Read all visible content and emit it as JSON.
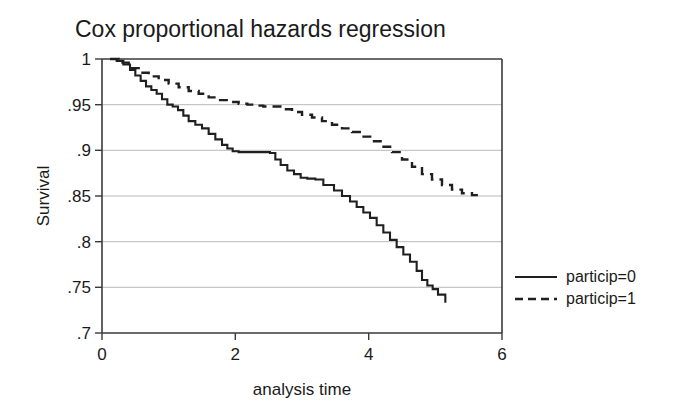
{
  "chart_data": {
    "type": "line",
    "title": "Cox proportional hazards regression",
    "xlabel": "analysis time",
    "ylabel": "Survival",
    "xlim": [
      0,
      6
    ],
    "ylim": [
      0.7,
      1.0
    ],
    "xticks": [
      0,
      2,
      4,
      6
    ],
    "xtick_labels": [
      "0",
      "2",
      "4",
      "6"
    ],
    "yticks": [
      0.7,
      0.75,
      0.8,
      0.85,
      0.9,
      0.95,
      1.0
    ],
    "ytick_labels": [
      ".7",
      ".75",
      ".8",
      ".85",
      ".9",
      ".95",
      "1"
    ],
    "grid": "horizontal",
    "legend_position": "right",
    "step_type": "post",
    "series": [
      {
        "name": "particip=0",
        "style": "solid",
        "color": "#1f1f1f",
        "x": [
          0.12,
          0.22,
          0.32,
          0.42,
          0.5,
          0.58,
          0.66,
          0.74,
          0.82,
          0.9,
          0.98,
          1.06,
          1.14,
          1.22,
          1.3,
          1.4,
          1.5,
          1.6,
          1.7,
          1.8,
          1.88,
          1.96,
          2.05,
          2.2,
          2.35,
          2.52,
          2.6,
          2.68,
          2.78,
          2.88,
          2.98,
          3.08,
          3.2,
          3.32,
          3.48,
          3.6,
          3.72,
          3.82,
          3.92,
          4.02,
          4.12,
          4.22,
          4.32,
          4.42,
          4.52,
          4.62,
          4.72,
          4.8,
          4.88,
          4.96,
          5.04,
          5.15
        ],
        "y": [
          1.0,
          0.998,
          0.994,
          0.988,
          0.982,
          0.976,
          0.97,
          0.966,
          0.962,
          0.956,
          0.95,
          0.948,
          0.944,
          0.938,
          0.932,
          0.928,
          0.924,
          0.918,
          0.912,
          0.906,
          0.902,
          0.899,
          0.898,
          0.898,
          0.898,
          0.897,
          0.89,
          0.884,
          0.878,
          0.874,
          0.87,
          0.869,
          0.868,
          0.862,
          0.856,
          0.85,
          0.844,
          0.838,
          0.832,
          0.826,
          0.818,
          0.81,
          0.802,
          0.794,
          0.786,
          0.778,
          0.768,
          0.758,
          0.752,
          0.748,
          0.742,
          0.733
        ]
      },
      {
        "name": "particip=1",
        "style": "dashed",
        "color": "#1f1f1f",
        "x": [
          0.12,
          0.25,
          0.4,
          0.55,
          0.7,
          0.85,
          1.0,
          1.15,
          1.3,
          1.45,
          1.6,
          1.75,
          1.9,
          2.05,
          2.18,
          2.3,
          2.42,
          2.55,
          2.7,
          2.85,
          3.0,
          3.15,
          3.3,
          3.45,
          3.6,
          3.75,
          3.9,
          4.05,
          4.2,
          4.35,
          4.5,
          4.65,
          4.8,
          4.95,
          5.1,
          5.25,
          5.4,
          5.55,
          5.7
        ],
        "y": [
          1.0,
          0.996,
          0.99,
          0.985,
          0.981,
          0.977,
          0.973,
          0.969,
          0.965,
          0.962,
          0.958,
          0.955,
          0.953,
          0.951,
          0.95,
          0.949,
          0.948,
          0.948,
          0.945,
          0.942,
          0.939,
          0.936,
          0.932,
          0.928,
          0.924,
          0.92,
          0.915,
          0.91,
          0.904,
          0.898,
          0.89,
          0.882,
          0.874,
          0.868,
          0.862,
          0.857,
          0.853,
          0.851,
          0.851
        ]
      }
    ]
  },
  "legend": {
    "items": [
      {
        "label": "particip=0",
        "style": "solid"
      },
      {
        "label": "particip=1",
        "style": "dashed"
      }
    ]
  }
}
